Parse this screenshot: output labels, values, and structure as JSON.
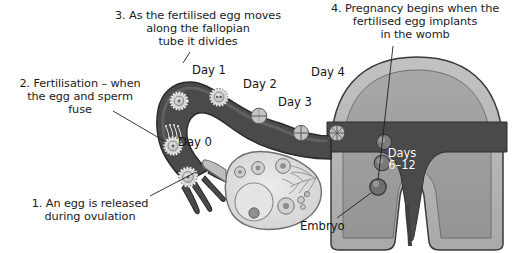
{
  "diagram": {
    "type": "anatomical-illustration"
  },
  "annotations": [
    {
      "id": "step-1",
      "number": "1",
      "text": "1. An egg is released\nduring ovulation",
      "points_to": "ovary-ovulation-site"
    },
    {
      "id": "step-2",
      "number": "2",
      "text": "2. Fertilisation – when\nthe egg and sperm\nfuse",
      "points_to": "fertilisation-site-in-tube"
    },
    {
      "id": "step-3",
      "number": "3",
      "text": "3. As the fertilised egg moves\nalong the fallopian\ntube it divides",
      "points_to": "fallopian-tube"
    },
    {
      "id": "step-4",
      "number": "4",
      "text": "4. Pregnancy begins when the\nfertilised egg implants\nin the womb",
      "points_to": "uterus-implantation-site"
    }
  ],
  "day_labels": [
    {
      "id": "day-0",
      "text": "Day 0",
      "meaning": "ovulation / fertilisation"
    },
    {
      "id": "day-1",
      "text": "Day 1",
      "meaning": "two-cell stage"
    },
    {
      "id": "day-2",
      "text": "Day 2",
      "meaning": "four-cell stage"
    },
    {
      "id": "day-3",
      "text": "Day 3",
      "meaning": "morula"
    },
    {
      "id": "day-4",
      "text": "Day 4",
      "meaning": "blastocyst enters womb"
    },
    {
      "id": "days-6-12",
      "text": "Days\n6–12",
      "meaning": "implantation window"
    }
  ],
  "structure_labels": [
    {
      "id": "embryo",
      "text": "Embryo"
    }
  ],
  "colors": {
    "tube_dark": "#4a4a4a",
    "tube_outline": "#2b2b2b",
    "uterus_wall": "#b5b5b5",
    "uterus_inner": "#9a9a9a",
    "cavity_dark": "#4a4a4a",
    "ovary_light": "#dedede",
    "cell_fill": "#c9c9c9",
    "background": "#ffffff",
    "text": "#1b1b1b",
    "text_on_dark": "#ffffff"
  }
}
